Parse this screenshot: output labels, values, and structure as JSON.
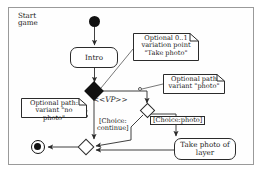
{
  "diagram": {
    "type": "uml-activity-diagram",
    "title": "Start\ngame",
    "frame_border_color": "#9a9a9a",
    "line_color": "#2b2b2b",
    "fill_color": "#111111",
    "nodes": {
      "start": "initial-node",
      "intro": "Intro",
      "variation_point": "<<VP>>",
      "take_photo": "Take photo\nof layer",
      "decision": "decision-node",
      "merge": "merge-node",
      "end": "final-node"
    },
    "notes": [
      {
        "id": "note-vp",
        "text": "Optional 0..1\nvariation point\n\"Take photo\""
      },
      {
        "id": "note-photo",
        "text": "Optional path\nvariant \"photo\""
      },
      {
        "id": "note-nophoto",
        "text": "Optional path:\nvariant \"no photo\""
      }
    ],
    "guards": [
      {
        "id": "guard-continue",
        "text": "[Choice:\ncontinue]"
      },
      {
        "id": "guard-photo",
        "text": "[Choice:photo]"
      }
    ]
  }
}
